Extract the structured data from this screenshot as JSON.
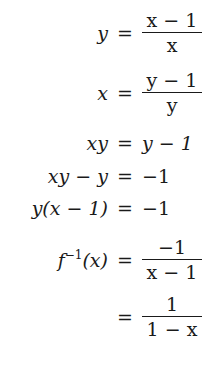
{
  "derivation": {
    "rows": [
      {
        "lhs": "y",
        "rel": "=",
        "rhs_num": "x − 1",
        "rhs_den": "x"
      },
      {
        "lhs": "x",
        "rel": "=",
        "rhs_num": "y − 1",
        "rhs_den": "y"
      },
      {
        "lhs": "xy",
        "rel": "=",
        "rhs": "y − 1"
      },
      {
        "lhs": "xy − y",
        "rel": "=",
        "rhs": "−1"
      },
      {
        "lhs": "y(x − 1)",
        "rel": "=",
        "rhs": "−1"
      },
      {
        "lhs_base": "f",
        "lhs_sup": "−1",
        "lhs_arg": "(x)",
        "rel": "=",
        "rhs_num": "−1",
        "rhs_den": "x − 1"
      },
      {
        "lhs": "",
        "rel": "=",
        "rhs_num": "1",
        "rhs_den": "1 − x"
      }
    ]
  },
  "colors": {
    "text": "#1a1a1a",
    "background": "#ffffff"
  }
}
